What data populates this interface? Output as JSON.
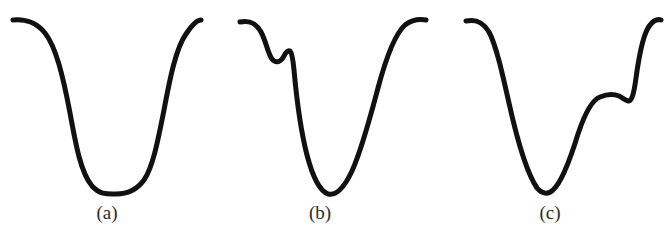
{
  "figure": {
    "background_color": "#ffffff",
    "stroke_color": "#111111",
    "caption_color": "#2b2b2b",
    "width": 670,
    "height": 236,
    "panels": [
      {
        "id": "a",
        "caption": "(a)",
        "description": "symmetric broad U-shaped trough with flat plateaus on both sides",
        "stroke_width": 5.0,
        "path": "M 13 20 C 26 19, 36 22, 45 33 C 56 47, 63 76, 70 113 C 76 146, 81 173, 92 186 C 100 195, 108 194, 116 194 C 126 194, 136 191, 144 180 C 153 167, 158 140, 164 110 C 170 78, 176 48, 186 34 C 192 25, 197 20, 201 20"
      },
      {
        "id": "b",
        "caption": "(b)",
        "description": "trough with a secondary shoulder bump on the left flank, narrow V-shaped minimum",
        "stroke_width": 5.0,
        "path": "M 240 22 C 250 20, 256 23, 261 32 C 266 41, 268 54, 272 59 C 276 64, 281 62, 284 56 C 286 52, 288 50, 290 51 C 292 53, 293 59, 294 70 C 296 92, 300 128, 307 155 C 313 178, 320 191, 328 194 C 336 196, 344 188, 352 171 C 362 149, 370 118, 378 88 C 386 58, 395 34, 405 25 C 413 19, 420 19, 426 20"
      },
      {
        "id": "c",
        "caption": "(c)",
        "description": "trough with a secondary shoulder bump on the right flank, narrow V-shaped minimum",
        "stroke_width": 5.0,
        "path": "M 466 21 C 476 19, 483 22, 489 32 C 496 45, 502 72, 509 103 C 517 139, 527 173, 537 188 C 542 194, 548 195, 553 190 C 562 182, 570 160, 578 134 C 585 113, 592 100, 600 97 C 607 94, 614 94, 619 96 C 623 98, 626 101, 629 101 C 632 100, 634 93, 636 78 C 639 56, 643 33, 650 25 C 654 20, 658 19, 661 20"
      }
    ]
  }
}
